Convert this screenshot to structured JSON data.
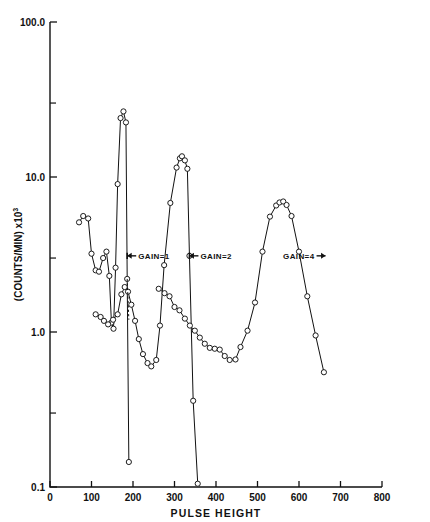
{
  "chart_data": {
    "type": "line",
    "title": "",
    "xlabel": "PULSE  HEIGHT",
    "ylabel": "(COUNTS/MIN) x10",
    "ylabel_exponent": "3",
    "xlim": [
      0,
      800
    ],
    "ylim": [
      0.1,
      100.0
    ],
    "yscale": "log",
    "xscale": "linear",
    "grid": false,
    "legend": "none",
    "xticks": [
      0,
      100,
      200,
      300,
      400,
      500,
      600,
      700,
      800
    ],
    "xticklabels": [
      "0",
      "100",
      "200",
      "300",
      "400",
      "500",
      "600",
      "700",
      "800"
    ],
    "yticks": [
      0.1,
      1.0,
      10.0,
      100.0
    ],
    "yticklabels": [
      "0.1",
      "1.0",
      "10.0",
      "100.0"
    ],
    "yminorticks": [
      0.3,
      3.0,
      30.0
    ],
    "annotations": [
      {
        "text": "GAIN=1",
        "x": 205,
        "y": 3.1,
        "arrow": "left",
        "marker_x": 186
      },
      {
        "text": "GAIN=2",
        "x": 355,
        "y": 3.1,
        "arrow": "left",
        "marker_x": 336
      },
      {
        "text": "GAIN=4",
        "x": 570,
        "y": 3.1,
        "arrow": "right",
        "marker_x": 625
      }
    ],
    "series": [
      {
        "name": "gain-1-spectrum",
        "marker": "open-circle",
        "points": [
          [
            70,
            5.1
          ],
          [
            80,
            5.6
          ],
          [
            92,
            5.4
          ],
          [
            100,
            3.2
          ],
          [
            110,
            2.5
          ],
          [
            118,
            2.45
          ],
          [
            128,
            3.0
          ],
          [
            136,
            3.3
          ],
          [
            143,
            2.3
          ],
          [
            148,
            1.15
          ],
          [
            153,
            1.05
          ],
          [
            158,
            2.6
          ],
          [
            163,
            9.0
          ],
          [
            170,
            24.0
          ],
          [
            177,
            26.5
          ],
          [
            183,
            22.5
          ],
          [
            186,
            2.2
          ],
          [
            190,
            0.145
          ]
        ]
      },
      {
        "name": "gain-2-spectrum",
        "marker": "open-circle",
        "points": [
          [
            110,
            1.3
          ],
          [
            122,
            1.25
          ],
          [
            130,
            1.18
          ],
          [
            140,
            1.12
          ],
          [
            152,
            1.2
          ],
          [
            163,
            1.3
          ],
          [
            172,
            1.75
          ],
          [
            180,
            1.95
          ],
          [
            188,
            1.82
          ],
          [
            196,
            1.5
          ],
          [
            205,
            1.18
          ],
          [
            214,
            0.9
          ],
          [
            224,
            0.72
          ],
          [
            235,
            0.63
          ],
          [
            244,
            0.6
          ],
          [
            256,
            0.66
          ],
          [
            265,
            1.1
          ],
          [
            275,
            2.7
          ],
          [
            290,
            6.8
          ],
          [
            305,
            11.5
          ],
          [
            313,
            13.2
          ],
          [
            318,
            13.6
          ],
          [
            325,
            12.8
          ],
          [
            331,
            11.3
          ],
          [
            336,
            3.1
          ],
          [
            345,
            0.36
          ],
          [
            356,
            0.105
          ]
        ]
      },
      {
        "name": "gain-4-spectrum",
        "marker": "open-circle",
        "points": [
          [
            262,
            1.9
          ],
          [
            276,
            1.78
          ],
          [
            288,
            1.7
          ],
          [
            300,
            1.45
          ],
          [
            312,
            1.38
          ],
          [
            325,
            1.22
          ],
          [
            337,
            1.1
          ],
          [
            349,
            1.02
          ],
          [
            361,
            0.92
          ],
          [
            373,
            0.84
          ],
          [
            385,
            0.79
          ],
          [
            397,
            0.78
          ],
          [
            409,
            0.77
          ],
          [
            421,
            0.7
          ],
          [
            433,
            0.66
          ],
          [
            447,
            0.665
          ],
          [
            459,
            0.8
          ],
          [
            476,
            1.02
          ],
          [
            494,
            1.55
          ],
          [
            512,
            3.3
          ],
          [
            530,
            5.55
          ],
          [
            545,
            6.55
          ],
          [
            553,
            6.85
          ],
          [
            562,
            6.95
          ],
          [
            570,
            6.6
          ],
          [
            582,
            5.6
          ],
          [
            600,
            3.3
          ],
          [
            620,
            1.7
          ],
          [
            640,
            0.95
          ],
          [
            660,
            0.55
          ]
        ]
      }
    ]
  }
}
